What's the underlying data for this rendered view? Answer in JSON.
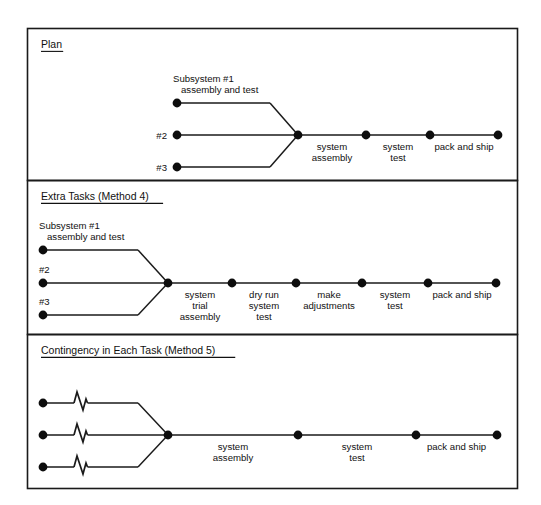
{
  "figure": {
    "type": "schedule-network-diagram",
    "width": 541,
    "height": 505,
    "background": "#ffffff",
    "ink_color": "#111111",
    "outer_frame": {
      "x": 27,
      "y": 28,
      "width": 490,
      "height": 460
    }
  },
  "panels": [
    {
      "id": "plan",
      "title": "Plan",
      "frame": {
        "x": 27,
        "y": 28,
        "width": 490,
        "height": 152
      },
      "title_pos": {
        "x": 41,
        "y": 48
      },
      "inputs": [
        {
          "id": "subsystem-1",
          "label": "Subsystem #1\nassembly and test",
          "label_lines": [
            "Subsystem #1",
            "assembly and test"
          ],
          "label_pos": "above",
          "dot": {
            "x": 177,
            "y": 103
          },
          "line_end": {
            "x": 270,
            "y": 103
          },
          "break_mark": false
        },
        {
          "id": "subsystem-2",
          "label": "#2",
          "label_lines": [
            "#2"
          ],
          "label_pos": "left",
          "dot": {
            "x": 177,
            "y": 135
          },
          "line_end": {
            "x": 298,
            "y": 135
          },
          "break_mark": false
        },
        {
          "id": "subsystem-3",
          "label": "#3",
          "label_lines": [
            "#3"
          ],
          "label_pos": "left",
          "dot": {
            "x": 177,
            "y": 167
          },
          "line_end": {
            "x": 270,
            "y": 167
          },
          "break_mark": false
        }
      ],
      "merge": {
        "x": 298,
        "y": 135
      },
      "chain": [
        {
          "id": "system-assembly",
          "label_lines": [
            "system",
            "assembly"
          ],
          "dot": {
            "x": 298,
            "y": 135
          }
        },
        {
          "id": "system-test",
          "label_lines": [
            "system",
            "test"
          ],
          "dot": {
            "x": 366,
            "y": 135
          }
        },
        {
          "id": "pack-and-ship",
          "label_lines": [
            "pack and ship"
          ],
          "dot": {
            "x": 430,
            "y": 135
          }
        },
        {
          "id": "end-node",
          "label_lines": [],
          "dot": {
            "x": 498,
            "y": 135
          }
        }
      ]
    },
    {
      "id": "extra-tasks",
      "title": "Extra Tasks (Method 4)",
      "frame": {
        "x": 27,
        "y": 180,
        "width": 490,
        "height": 154
      },
      "title_pos": {
        "x": 41,
        "y": 200
      },
      "inputs": [
        {
          "id": "subsystem-1",
          "label": "Subsystem #1\nassembly and test",
          "label_lines": [
            "Subsystem #1",
            "assembly and test"
          ],
          "label_pos": "above",
          "dot": {
            "x": 43,
            "y": 250
          },
          "line_end": {
            "x": 138,
            "y": 250
          },
          "break_mark": false
        },
        {
          "id": "subsystem-2",
          "label": "#2",
          "label_lines": [
            "#2"
          ],
          "label_pos": "above",
          "dot": {
            "x": 43,
            "y": 283
          },
          "line_end": {
            "x": 168,
            "y": 283
          },
          "break_mark": false
        },
        {
          "id": "subsystem-3",
          "label": "#3",
          "label_lines": [
            "#3"
          ],
          "label_pos": "above",
          "dot": {
            "x": 43,
            "y": 315
          },
          "line_end": {
            "x": 138,
            "y": 315
          },
          "break_mark": false
        }
      ],
      "merge": {
        "x": 168,
        "y": 283
      },
      "chain": [
        {
          "id": "system-trial-assembly",
          "label_lines": [
            "system",
            "trial",
            "assembly"
          ],
          "dot": {
            "x": 168,
            "y": 283
          }
        },
        {
          "id": "dry-run-system-test",
          "label_lines": [
            "dry run",
            "system",
            "test"
          ],
          "dot": {
            "x": 232,
            "y": 283
          }
        },
        {
          "id": "make-adjustments",
          "label_lines": [
            "make",
            "adjustments"
          ],
          "dot": {
            "x": 296,
            "y": 283
          }
        },
        {
          "id": "system-test",
          "label_lines": [
            "system",
            "test"
          ],
          "dot": {
            "x": 362,
            "y": 283
          }
        },
        {
          "id": "pack-and-ship",
          "label_lines": [
            "pack and ship"
          ],
          "dot": {
            "x": 428,
            "y": 283
          }
        },
        {
          "id": "end-node",
          "label_lines": [],
          "dot": {
            "x": 496,
            "y": 283
          }
        }
      ]
    },
    {
      "id": "contingency",
      "title": "Contingency in Each Task (Method 5)",
      "frame": {
        "x": 27,
        "y": 334,
        "width": 490,
        "height": 154
      },
      "title_pos": {
        "x": 41,
        "y": 354
      },
      "inputs": [
        {
          "id": "subsystem-1",
          "label": "",
          "label_lines": [],
          "label_pos": "none",
          "dot": {
            "x": 43,
            "y": 403
          },
          "line_end": {
            "x": 138,
            "y": 403
          },
          "break_mark": true,
          "break_x": 78
        },
        {
          "id": "subsystem-2",
          "label": "",
          "label_lines": [],
          "label_pos": "none",
          "dot": {
            "x": 43,
            "y": 435
          },
          "line_end": {
            "x": 168,
            "y": 435
          },
          "break_mark": true,
          "break_x": 78
        },
        {
          "id": "subsystem-3",
          "label": "",
          "label_lines": [],
          "label_pos": "none",
          "dot": {
            "x": 43,
            "y": 467
          },
          "line_end": {
            "x": 138,
            "y": 467
          },
          "break_mark": true,
          "break_x": 78
        }
      ],
      "merge": {
        "x": 168,
        "y": 435
      },
      "chain": [
        {
          "id": "system-assembly",
          "label_lines": [
            "system",
            "assembly"
          ],
          "dot": {
            "x": 168,
            "y": 435
          }
        },
        {
          "id": "system-test",
          "label_lines": [
            "system",
            "test"
          ],
          "dot": {
            "x": 298,
            "y": 435
          }
        },
        {
          "id": "pack-and-ship",
          "label_lines": [
            "pack and ship"
          ],
          "dot": {
            "x": 416,
            "y": 435
          }
        },
        {
          "id": "end-node",
          "label_lines": [],
          "dot": {
            "x": 497,
            "y": 435
          }
        }
      ]
    }
  ]
}
